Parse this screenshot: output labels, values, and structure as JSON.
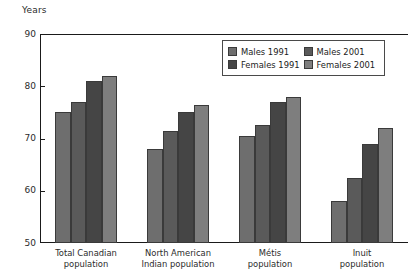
{
  "chart_data": {
    "type": "bar",
    "title": "",
    "ylabel": "Years",
    "xlabel": "",
    "ylim": [
      50,
      90
    ],
    "yticks": [
      50,
      60,
      70,
      80,
      90
    ],
    "grid": false,
    "legend_position": "top-right",
    "categories": [
      "Total Canadian\npopulation",
      "North American\nIndian population",
      "Métis\npopulation",
      "Inuit\npopulation"
    ],
    "category_lines": [
      [
        "Total Canadian",
        "population"
      ],
      [
        "North American",
        "Indian population"
      ],
      [
        "Métis",
        "population"
      ],
      [
        "Inuit",
        "population"
      ]
    ],
    "series": [
      {
        "name": "Males 1991",
        "color": "#6e6e6e",
        "values": [
          75.0,
          68.0,
          70.5,
          58.0
        ]
      },
      {
        "name": "Males 2001",
        "color": "#5a5a5a",
        "values": [
          77.0,
          71.5,
          72.5,
          62.5
        ]
      },
      {
        "name": "Females 1991",
        "color": "#454545",
        "values": [
          81.0,
          75.0,
          77.0,
          69.0
        ]
      },
      {
        "name": "Females 2001",
        "color": "#7e7e7e",
        "values": [
          82.0,
          76.5,
          78.0,
          72.0
        ]
      }
    ]
  },
  "legend": {
    "entries": [
      {
        "label": "Males 1991",
        "color": "#6e6e6e"
      },
      {
        "label": "Males 2001",
        "color": "#5a5a5a"
      },
      {
        "label": "Females 1991",
        "color": "#454545"
      },
      {
        "label": "Females 2001",
        "color": "#7e7e7e"
      }
    ]
  }
}
